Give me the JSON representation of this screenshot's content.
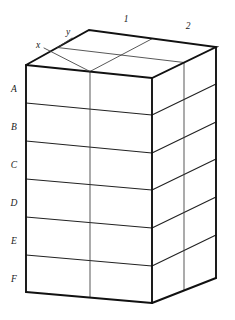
{
  "figure": {
    "type": "3d-grid-cuboid",
    "axes": {
      "x_label": "x",
      "y_label": "y",
      "z_label": "",
      "x_axis_name": "x",
      "y_axis_name": "y"
    },
    "dimensions": {
      "rows": 6,
      "front_columns": 2,
      "side_columns": 2,
      "depth_layers": 2
    },
    "row_labels": [
      "A",
      "B",
      "C",
      "D",
      "E",
      "F"
    ],
    "column_labels": [
      "1",
      "2"
    ],
    "colors": {
      "outline": "#111111",
      "inner_line": "#3a3a3a",
      "face": "#ffffff",
      "background": "#ffffff",
      "text": "#1a1a1a"
    },
    "geometry": {
      "front_top_left": [
        26,
        65
      ],
      "front_top_right": [
        152,
        78
      ],
      "front_bottom_left": [
        26,
        292
      ],
      "front_bottom_right": [
        152,
        303
      ],
      "back_top_apex": [
        89,
        30
      ],
      "right_top_back": [
        216,
        47
      ],
      "right_bottom_back": [
        216,
        278
      ],
      "front_vertical_divider_x": 90,
      "row_boundary_y_left": [
        65,
        103,
        141,
        179,
        217,
        255,
        292
      ],
      "row_boundary_y_right": [
        78,
        115,
        153,
        190,
        228,
        266,
        303
      ]
    },
    "label_positions": {
      "row_label_x": 14,
      "row_label_y": [
        90,
        128,
        166,
        204,
        242,
        280
      ],
      "col_label_1": [
        126,
        20
      ],
      "col_label_2": [
        188,
        27
      ],
      "axis_x_label": [
        38,
        46
      ],
      "axis_y_label": [
        68,
        33
      ]
    }
  }
}
